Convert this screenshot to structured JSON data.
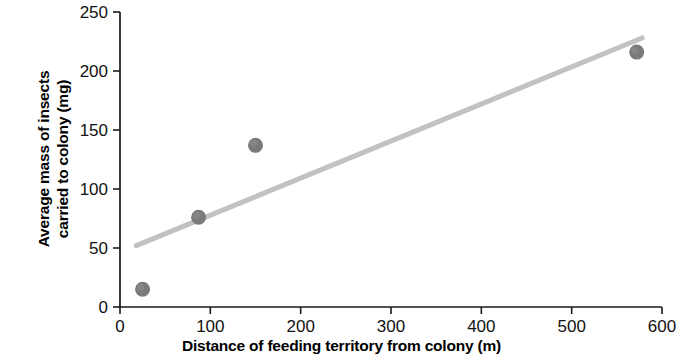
{
  "chart_data": {
    "type": "scatter",
    "title": "",
    "xlabel": "Distance of feeding territory from colony (m)",
    "ylabel": "Average mass of insects\ncarried to colony (mg)",
    "ylabel_line1": "Average mass of insects",
    "ylabel_line2": "carried to colony (mg)",
    "xlim": [
      0,
      600
    ],
    "ylim": [
      0,
      250
    ],
    "xticks": [
      0,
      100,
      200,
      300,
      400,
      500,
      600
    ],
    "yticks": [
      0,
      50,
      100,
      150,
      200,
      250
    ],
    "xtick_labels": [
      "0",
      "100",
      "200",
      "300",
      "400",
      "500",
      "600"
    ],
    "ytick_labels": [
      "0",
      "50",
      "100",
      "150",
      "200",
      "250"
    ],
    "grid": false,
    "legend": false,
    "series": [
      {
        "name": "Insect mass vs distance",
        "marker": "circle",
        "color": "#7a7a7a",
        "x": [
          25,
          87,
          150,
          572
        ],
        "y": [
          15,
          76,
          137,
          216
        ],
        "points": [
          {
            "x": 25,
            "y": 15
          },
          {
            "x": 87,
            "y": 76
          },
          {
            "x": 150,
            "y": 137
          },
          {
            "x": 572,
            "y": 216
          }
        ]
      }
    ],
    "trendline": {
      "name": "line of best fit",
      "color": "#c2c2c2",
      "x_start": 18,
      "y_start": 52,
      "x_end": 578,
      "y_end": 228
    },
    "colors": {
      "point": "#7a7a7a",
      "trendline": "#c2c2c2",
      "axis": "#1a1a1a",
      "background": "#ffffff",
      "text": "#000000"
    }
  }
}
